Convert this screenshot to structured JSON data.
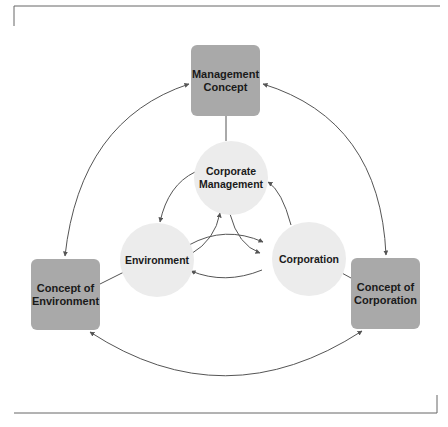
{
  "diagram": {
    "type": "concept-relationship",
    "outer_nodes": [
      {
        "id": "management_concept",
        "label": "Management\nConcept",
        "shape": "rounded-square"
      },
      {
        "id": "concept_of_environment",
        "label": "Concept of\nEnvironment",
        "shape": "rounded-square"
      },
      {
        "id": "concept_of_corporation",
        "label": "Concept of\nCorporation",
        "shape": "rounded-square"
      }
    ],
    "inner_nodes": [
      {
        "id": "corporate_management",
        "label": "Corporate\nManagement",
        "shape": "circle"
      },
      {
        "id": "environment",
        "label": "Environment",
        "shape": "circle"
      },
      {
        "id": "corporation",
        "label": "Corporation",
        "shape": "circle"
      }
    ],
    "edges": [
      {
        "from": "management_concept",
        "to": "concept_of_environment",
        "style": "double-arrow-arc"
      },
      {
        "from": "management_concept",
        "to": "concept_of_corporation",
        "style": "double-arrow-arc"
      },
      {
        "from": "concept_of_environment",
        "to": "concept_of_corporation",
        "style": "double-arrow-arc"
      },
      {
        "from": "management_concept",
        "to": "corporate_management",
        "style": "line"
      },
      {
        "from": "concept_of_environment",
        "to": "environment",
        "style": "line"
      },
      {
        "from": "concept_of_corporation",
        "to": "corporation",
        "style": "line"
      },
      {
        "from": "corporate_management",
        "to": "environment",
        "style": "arrow"
      },
      {
        "from": "environment",
        "to": "corporate_management",
        "style": "arrow"
      },
      {
        "from": "corporate_management",
        "to": "corporation",
        "style": "arrow"
      },
      {
        "from": "corporation",
        "to": "corporate_management",
        "style": "arrow"
      },
      {
        "from": "environment",
        "to": "corporation",
        "style": "arrow"
      },
      {
        "from": "corporation",
        "to": "environment",
        "style": "arrow"
      }
    ],
    "colors": {
      "outer_box": "#a9a9a9",
      "inner_circle": "#ececec",
      "line": "#555555",
      "frame": "#666666"
    }
  }
}
